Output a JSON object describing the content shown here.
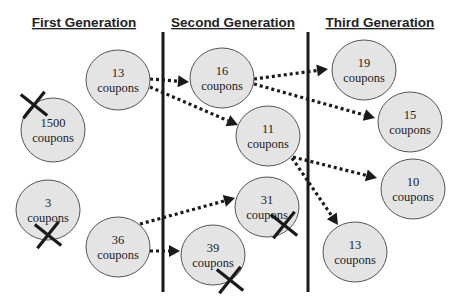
{
  "headings": {
    "first": "First Generation",
    "second": "Second Generation",
    "third": "Third Generation"
  },
  "unit": "coupons",
  "nodes": {
    "g1_13": {
      "count": "13",
      "label": "coupons",
      "generation": 1,
      "eliminated": false
    },
    "g1_1500": {
      "count": "1500",
      "label": "coupons",
      "generation": 1,
      "eliminated": true
    },
    "g1_3": {
      "count": "3",
      "label": "coupons",
      "generation": 1,
      "eliminated": true
    },
    "g1_36": {
      "count": "36",
      "label": "coupons",
      "generation": 1,
      "eliminated": false
    },
    "g2_16": {
      "count": "16",
      "label": "coupons",
      "generation": 2,
      "eliminated": false
    },
    "g2_11": {
      "count": "11",
      "label": "coupons",
      "generation": 2,
      "eliminated": false
    },
    "g2_31": {
      "count": "31",
      "label": "coupons",
      "generation": 2,
      "eliminated": true
    },
    "g2_39": {
      "count": "39",
      "label": "coupons",
      "generation": 2,
      "eliminated": true
    },
    "g3_19": {
      "count": "19",
      "label": "coupons",
      "generation": 3,
      "eliminated": false
    },
    "g3_15": {
      "count": "15",
      "label": "coupons",
      "generation": 3,
      "eliminated": false
    },
    "g3_10": {
      "count": "10",
      "label": "coupons",
      "generation": 3,
      "eliminated": false
    },
    "g3_13": {
      "count": "13",
      "label": "coupons",
      "generation": 3,
      "eliminated": false
    }
  },
  "edges": [
    {
      "from": "g1_13",
      "to": "g2_16"
    },
    {
      "from": "g1_13",
      "to": "g2_11"
    },
    {
      "from": "g1_36",
      "to": "g2_31"
    },
    {
      "from": "g1_36",
      "to": "g2_39"
    },
    {
      "from": "g2_16",
      "to": "g3_19"
    },
    {
      "from": "g2_16",
      "to": "g3_15"
    },
    {
      "from": "g2_11",
      "to": "g3_10"
    },
    {
      "from": "g2_11",
      "to": "g3_13"
    }
  ],
  "colors": {
    "node_fill": "#e4e4e4",
    "ink": "#1a1a1a"
  }
}
